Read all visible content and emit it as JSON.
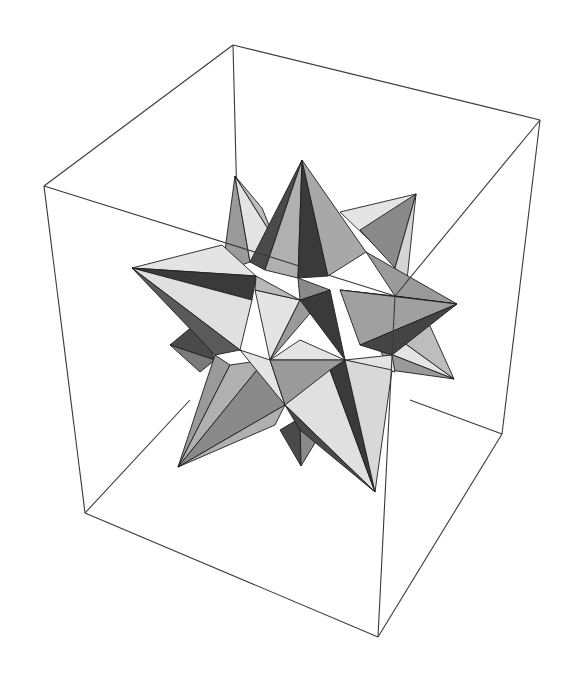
{
  "figure": {
    "colors": {
      "background": "#ffffff",
      "box_edge": "#3a3a3a",
      "face_outline": "#1e1e1e",
      "light": "#e4e4e4",
      "mid_light": "#bdbdbd",
      "mid": "#9a9a9a",
      "mid_dark": "#7a7a7a",
      "dark": "#4a4a4a",
      "darkest": "#333333"
    },
    "bounding_box": {
      "corners": {
        "top_back": [
          233,
          45
        ],
        "top_left": [
          44,
          186
        ],
        "top_right": [
          540,
          120
        ],
        "top_front": [
          395,
          296
        ],
        "bottom_left": [
          85,
          513
        ],
        "bottom_front": [
          378,
          637
        ],
        "bottom_right": [
          502,
          434
        ]
      }
    },
    "spike_tips": {
      "top": [
        302,
        160
      ],
      "back_left": [
        235,
        176
      ],
      "upper_right": [
        416,
        194
      ],
      "left": [
        132,
        268
      ],
      "right": [
        457,
        304
      ],
      "small_left": [
        170,
        345
      ],
      "lower_right": [
        454,
        379
      ],
      "bottom_left": [
        178,
        467
      ],
      "bottom_small": [
        301,
        466
      ],
      "bottom": [
        375,
        492
      ]
    }
  }
}
